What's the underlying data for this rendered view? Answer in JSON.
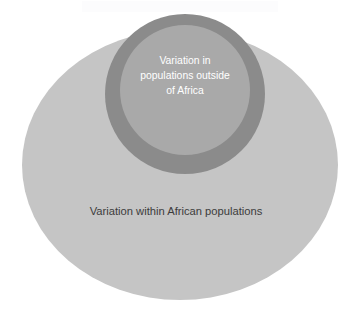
{
  "diagram": {
    "type": "venn-nested-circles",
    "background_color": "#ffffff",
    "outer_region": {
      "name": "african-populations-region",
      "label": "Variation within African populations",
      "color": "#c5c5c5",
      "shape": "ellipse",
      "cx": 180,
      "cy": 165,
      "rx": 158,
      "ry": 135
    },
    "middle_region": {
      "name": "outside-africa-ring",
      "label": "",
      "color": "#8b8b8b",
      "shape": "circle",
      "cx": 185,
      "cy": 94,
      "r": 80
    },
    "inner_region": {
      "name": "outside-africa-core",
      "label": "Variation in populations outside of Africa",
      "label_lines": [
        "Variation in",
        "populations outside",
        "of Africa"
      ],
      "color": "#a9a9a9",
      "shape": "circle",
      "cx": 185,
      "cy": 90,
      "r": 65
    },
    "text_colors": {
      "outer_label": "#3c3c3c",
      "inner_label": "#ffffff"
    }
  }
}
